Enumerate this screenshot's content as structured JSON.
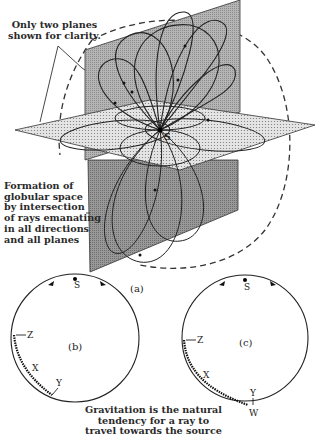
{
  "figure": {
    "annotations": {
      "top_note": "Only two planes\nshown for clarity.",
      "left_note": "Formation of\nglobular space\nby intersection\nof rays emanating\nin all directions\nand all planes",
      "bottom_caption": "Gravitation is the natural\ntendency for a ray to\ntravel towards the source"
    },
    "panel_a": {
      "label": "(a)",
      "source_label": "S",
      "description": "Two intersecting planes (vertical grey plane, horizontal stippled plane) with looping rays emanating from source S, enclosed by a dashed globular outline"
    },
    "panel_b": {
      "label": "(b)",
      "points": {
        "source": "S",
        "z": "Z",
        "x": "X",
        "y": "Y"
      }
    },
    "panel_c": {
      "label": "(c)",
      "points": {
        "source": "S",
        "z": "Z",
        "x": "X",
        "y": "Y",
        "w": "W"
      }
    },
    "colors": {
      "ink": "#222222",
      "vertical_plane": "#a9a9a9",
      "horizontal_plane": "#dcdcdc",
      "background": "#ffffff"
    }
  }
}
